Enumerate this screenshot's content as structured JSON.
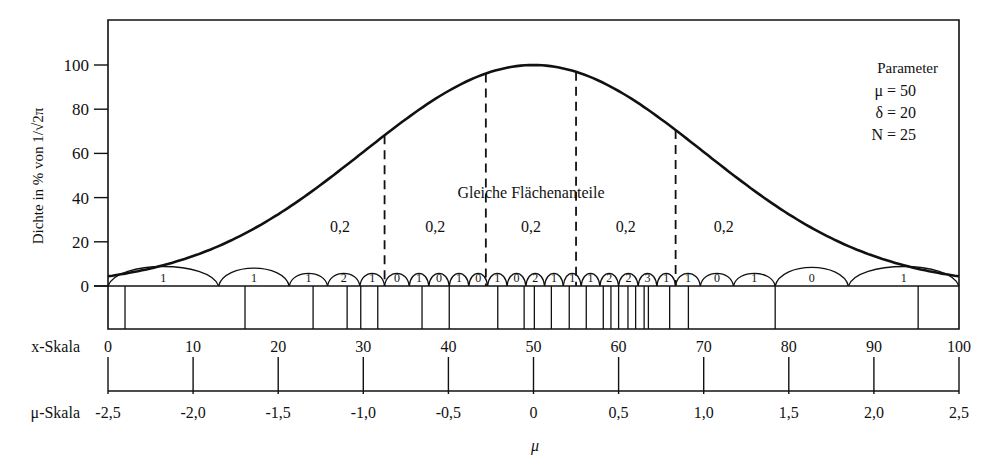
{
  "chart_data": {
    "type": "line",
    "title": "",
    "ylabel": "Dichte in % von 1/√2π",
    "xlabel": "μ",
    "ylim": [
      0,
      115
    ],
    "yticks": [
      0,
      20,
      40,
      60,
      80,
      100
    ],
    "xlim": [
      0,
      100
    ],
    "x_scale": {
      "label": "x-Skala",
      "ticks": [
        "0",
        "10",
        "20",
        "30",
        "40",
        "50",
        "60",
        "70",
        "80",
        "90",
        "100"
      ]
    },
    "mu_scale": {
      "label": "μ-Skala",
      "ticks": [
        "-2,5",
        "-2,0",
        "-1,5",
        "-1,0",
        "-0,5",
        "0",
        "0,5",
        "1,0",
        "1,5",
        "2,0",
        "2,5"
      ]
    },
    "parameters": {
      "heading": "Parameter",
      "lines": [
        "μ = 50",
        "δ = 20",
        "N = 25"
      ]
    },
    "curve": {
      "name": "Normal density",
      "mean": 50,
      "sd": 20,
      "peak_percent": 100
    },
    "equal_area": {
      "label": "Gleiche Flächenanteile",
      "boundaries_x": [
        32.5,
        44.4,
        55.0,
        66.7
      ],
      "segment_labels": [
        "0,2",
        "0,2",
        "0,2",
        "0,2",
        "0,2"
      ]
    },
    "arcs": {
      "boundaries_x": [
        0,
        13.0,
        21.3,
        25.8,
        29.6,
        32.5,
        35.4,
        37.7,
        40.1,
        42.4,
        44.6,
        46.9,
        49.1,
        51.3,
        53.5,
        55.6,
        57.8,
        60.0,
        62.3,
        64.5,
        66.7,
        69.6,
        73.5,
        78.4,
        87.0,
        100
      ],
      "counts": [
        "1",
        "1",
        "1",
        "2",
        "1",
        "0",
        "1",
        "0",
        "1",
        "0",
        "1",
        "0",
        "2",
        "1",
        "1",
        "1",
        "2",
        "2",
        "3",
        "1",
        "1",
        "0",
        "1",
        "0",
        "1"
      ]
    },
    "data_points_x": [
      2.0,
      16.1,
      24.1,
      28.1,
      29.7,
      31.7,
      36.9,
      40.1,
      45.8,
      48.9,
      50.1,
      52.1,
      54.2,
      56.2,
      58.2,
      59.1,
      60.0,
      61.1,
      62.0,
      63.0,
      63.5,
      66.0,
      68.2,
      78.4,
      95.2
    ]
  }
}
